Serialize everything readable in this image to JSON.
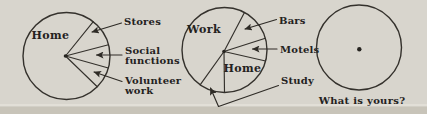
{
  "figure": {
    "paper_color": "#d8d5cd",
    "bottom_highlight_color": "#e2dfd7",
    "bottom_band_color": "#c8c4b9",
    "ink_color": "#2e2b26",
    "caption": "What is yours?"
  },
  "chart_data": [
    {
      "type": "pie",
      "name": "their-day-pie",
      "circle": {
        "cx": 66.5,
        "cy": 56,
        "r": 43.5
      },
      "center_dot": {
        "x": 65.5,
        "y": 56,
        "r": 1.8
      },
      "divider_angles_deg": [
        52,
        15,
        -16,
        -45
      ],
      "slices": [
        {
          "label": "Home",
          "start_deg": 52,
          "end_deg": 315,
          "approx_pct": 73
        },
        {
          "label": "Stores",
          "start_deg": 15,
          "end_deg": 52,
          "approx_pct": 10
        },
        {
          "label": "Social functions",
          "start_deg": -16,
          "end_deg": 15,
          "approx_pct": 9
        },
        {
          "label": "Volunteer work",
          "start_deg": -45,
          "end_deg": -16,
          "approx_pct": 8
        }
      ],
      "inside_labels": [
        {
          "text": "Home",
          "x": 50.5,
          "y": 38.5
        }
      ],
      "callouts": [
        {
          "lines": [
            "Stores"
          ],
          "x": 124,
          "y": 25,
          "leader": [
            [
              121.5,
              23
            ],
            [
              92,
              32
            ]
          ]
        },
        {
          "lines": [
            "Social",
            "functions"
          ],
          "x": 125,
          "y": 54,
          "leader": [
            [
              122,
              55
            ],
            [
              96.5,
              55
            ]
          ]
        },
        {
          "lines": [
            "Volunteer",
            "work"
          ],
          "x": 125,
          "y": 84,
          "leader": [
            [
              122,
              81.5
            ],
            [
              94,
              72
            ]
          ]
        }
      ]
    },
    {
      "type": "pie",
      "name": "his-day-pie",
      "circle": {
        "cx": 224.5,
        "cy": 50,
        "r": 42.5
      },
      "center_dot": {
        "x": 224,
        "y": 51.5,
        "r": 1.8
      },
      "divider_angles_deg": [
        62,
        16,
        -15,
        -90,
        -125
      ],
      "slices": [
        {
          "label": "Work",
          "start_deg": 62,
          "end_deg": 235,
          "approx_pct": 48
        },
        {
          "label": "Bars",
          "start_deg": 16,
          "end_deg": 62,
          "approx_pct": 13
        },
        {
          "label": "Motels",
          "start_deg": -15,
          "end_deg": 16,
          "approx_pct": 9
        },
        {
          "label": "Home",
          "start_deg": 270,
          "end_deg": 345,
          "approx_pct": 21
        },
        {
          "label": "Study",
          "start_deg": 235,
          "end_deg": 270,
          "approx_pct": 9
        }
      ],
      "inside_labels": [
        {
          "text": "Work",
          "x": 204,
          "y": 33
        },
        {
          "text": "Home",
          "x": 242.5,
          "y": 71.5
        }
      ],
      "callouts": [
        {
          "lines": [
            "Bars"
          ],
          "x": 279,
          "y": 23.5,
          "leader": [
            [
              276.5,
              19.5
            ],
            [
              245,
              29
            ]
          ]
        },
        {
          "lines": [
            "Motels"
          ],
          "x": 280,
          "y": 52.5,
          "leader": [
            [
              277,
              49
            ],
            [
              252.5,
              49
            ]
          ]
        },
        {
          "lines": [
            "Study"
          ],
          "x": 281,
          "y": 84,
          "leader": [
            [
              278.5,
              85.5
            ],
            [
              218.5,
              106.5
            ],
            [
              210.5,
              88
            ]
          ]
        }
      ]
    },
    {
      "type": "pie",
      "name": "yours-pie",
      "circle": {
        "cx": 359,
        "cy": 47.5,
        "r": 42.5
      },
      "center_dot": {
        "x": 359.3,
        "y": 49.3,
        "r": 2.2
      },
      "divider_angles_deg": [],
      "slices": [],
      "inside_labels": [],
      "callouts": [],
      "caption": {
        "text": "What is yours?",
        "x": 362,
        "y": 104
      }
    }
  ]
}
